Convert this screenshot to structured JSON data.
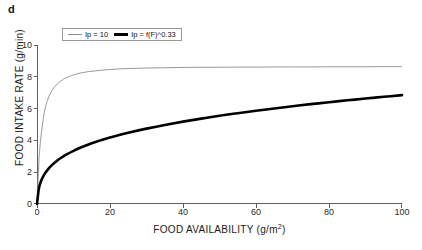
{
  "panel": {
    "letter": "d"
  },
  "legend": {
    "entries": [
      {
        "label": "Ip = 10",
        "style": "thin",
        "color": "#8c8c8c"
      },
      {
        "label": "Ip = f(F)^0.33",
        "style": "thick",
        "color": "#000000"
      }
    ]
  },
  "axes": {
    "y_title": "FOOD INTAKE RATE (g/min)",
    "x_title_main": "FOOD AVAILABILITY (g/m",
    "x_title_sup": "2",
    "x_title_close": ")",
    "y_ticks": [
      "0",
      "2",
      "4",
      "6",
      "8",
      "10"
    ],
    "x_ticks": [
      "0",
      "20",
      "40",
      "60",
      "80",
      "100"
    ]
  },
  "chart_data": {
    "type": "line",
    "title": "",
    "subtitle": "",
    "xlabel": "FOOD AVAILABILITY (g/m^2)",
    "ylabel": "FOOD INTAKE RATE (g/min)",
    "xlim": [
      0,
      100
    ],
    "ylim": [
      0,
      10
    ],
    "xticks": [
      0,
      20,
      40,
      60,
      80,
      100
    ],
    "yticks": [
      0,
      2,
      4,
      6,
      8,
      10
    ],
    "grid": false,
    "legend_position": "top-left-inside",
    "annotations": [
      "d"
    ],
    "x": [
      0,
      0.5,
      1,
      2,
      3,
      4,
      5,
      6,
      7,
      8,
      10,
      12,
      15,
      20,
      25,
      30,
      35,
      40,
      45,
      50,
      55,
      60,
      65,
      70,
      75,
      80,
      85,
      90,
      95,
      100
    ],
    "series": [
      {
        "name": "Ip = 10",
        "color": "#8c8c8c",
        "linewidth": "thin",
        "values": [
          0,
          2.55,
          4.05,
          5.75,
          6.6,
          7.1,
          7.42,
          7.65,
          7.81,
          7.94,
          8.12,
          8.24,
          8.35,
          8.46,
          8.52,
          8.55,
          8.57,
          8.59,
          8.6,
          8.6,
          8.61,
          8.61,
          8.62,
          8.62,
          8.62,
          8.63,
          8.63,
          8.63,
          8.64,
          8.64
        ]
      },
      {
        "name": "Ip = f(F)^0.33",
        "color": "#000000",
        "linewidth": "thick",
        "values": [
          0,
          0.95,
          1.38,
          1.86,
          2.18,
          2.43,
          2.63,
          2.81,
          2.96,
          3.1,
          3.34,
          3.55,
          3.82,
          4.18,
          4.48,
          4.74,
          4.97,
          5.18,
          5.37,
          5.55,
          5.71,
          5.87,
          6.01,
          6.15,
          6.28,
          6.4,
          6.52,
          6.63,
          6.74,
          6.85
        ]
      }
    ],
    "note": "Both curves are saturating (type-II-like) functional responses rising from the origin; the thin grey curve saturates rapidly near 8.6 g/min, the thick black curve rises gradually and approaches the grey curve near the right-hand edge of the axis."
  }
}
